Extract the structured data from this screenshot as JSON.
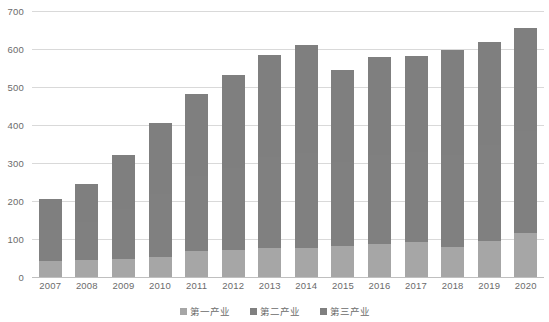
{
  "chart_data": {
    "type": "bar",
    "stacked": true,
    "title": "",
    "subtitle": "",
    "xlabel": "",
    "ylabel": "",
    "ylim": [
      0,
      700
    ],
    "ytick_step": 100,
    "yticks": [
      0,
      100,
      200,
      300,
      400,
      500,
      600,
      700
    ],
    "ytick_labels": [
      "0",
      "100",
      "200",
      "300",
      "400",
      "500",
      "600",
      "700"
    ],
    "grid": true,
    "legend_position": "bottom",
    "categories": [
      "2007",
      "2008",
      "2009",
      "2010",
      "2011",
      "2012",
      "2013",
      "2014",
      "2015",
      "2016",
      "2017",
      "2018",
      "2019",
      "2020"
    ],
    "series": [
      {
        "name": "第一产业",
        "color": "#a6a6a6",
        "values": [
          41,
          44,
          47,
          53,
          68,
          72,
          77,
          77,
          81,
          86,
          91,
          80,
          95,
          116
        ]
      },
      {
        "name": "第二产业",
        "color": "#808080",
        "values": [
          82,
          101,
          131,
          165,
          198,
          216,
          239,
          250,
          222,
          235,
          237,
          242,
          252,
          268
        ]
      },
      {
        "name": "第三产业",
        "color": "#7f7f7f",
        "values": [
          82,
          101,
          144,
          187,
          215,
          243,
          269,
          283,
          242,
          257,
          253,
          275,
          272,
          272
        ]
      }
    ],
    "totals": [
      205,
      246,
      322,
      405,
      481,
      531,
      585,
      610,
      545,
      578,
      581,
      597,
      619,
      656
    ]
  },
  "legend": {
    "items": [
      {
        "label": "第一产业",
        "color": "#a6a6a6"
      },
      {
        "label": "第二产业",
        "color": "#808080"
      },
      {
        "label": "第三产业",
        "color": "#7f7f7f"
      }
    ]
  },
  "colors": {
    "series1": "#a6a6a6",
    "series2": "#808080",
    "series3": "#7f7f7f",
    "gridline": "#d9d9d9",
    "baseline": "#bfbfbf",
    "tick_text": "#6b6b6b",
    "background": "#ffffff"
  }
}
